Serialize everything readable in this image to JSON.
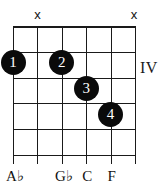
{
  "diagram": {
    "position_label": "IV",
    "strings": 6,
    "frets": 5,
    "colors": {
      "line": "#1a1a1a",
      "dot_fill": "#0a0a0a",
      "dot_text": "#ffffff",
      "background": "#ffffff"
    },
    "string_markers": [
      {
        "string": 2,
        "symbol": "x",
        "meaning": "muted"
      },
      {
        "string": 6,
        "symbol": "x",
        "meaning": "muted"
      }
    ],
    "fingerings": [
      {
        "finger": "1",
        "string": 1,
        "fret": 1
      },
      {
        "finger": "2",
        "string": 3,
        "fret": 1
      },
      {
        "finger": "3",
        "string": 4,
        "fret": 2
      },
      {
        "finger": "4",
        "string": 5,
        "fret": 3
      }
    ],
    "note_labels": [
      {
        "string": 1,
        "text": "A♭"
      },
      {
        "string": 3,
        "text": "G♭"
      },
      {
        "string": 4,
        "text": "C"
      },
      {
        "string": 5,
        "text": "F"
      }
    ]
  }
}
